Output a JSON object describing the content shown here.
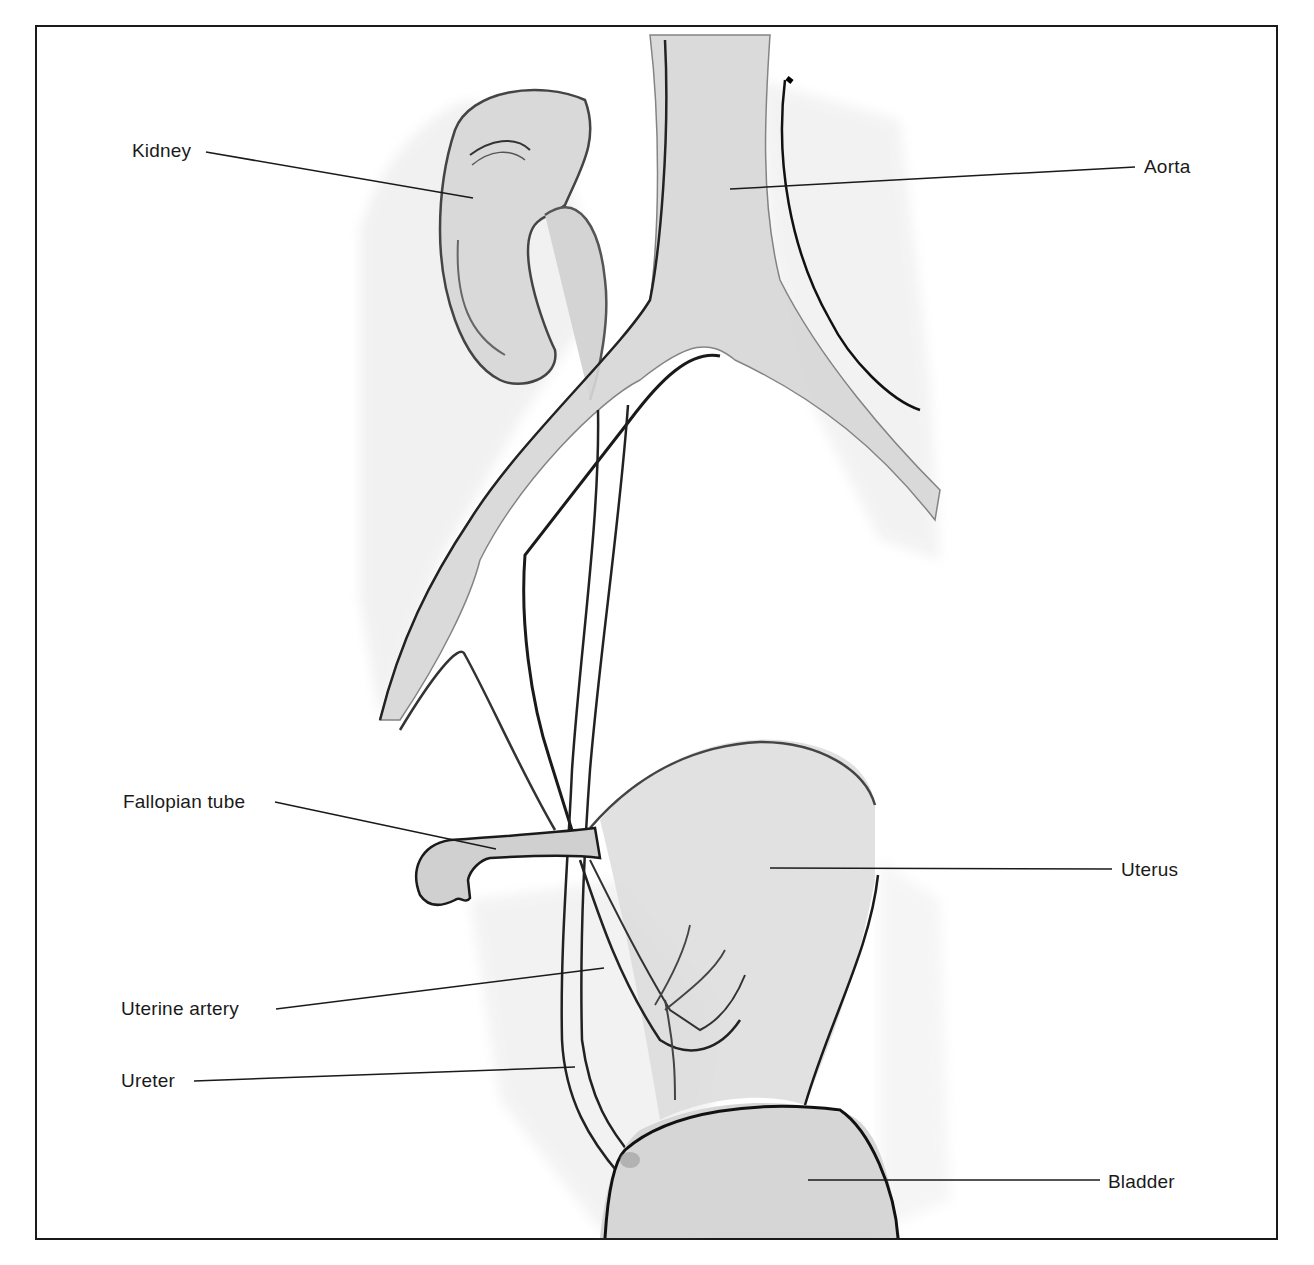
{
  "diagram": {
    "style": "grayscale pencil illustration",
    "colors": {
      "ink": "#1a1a1a",
      "shade": "#d8d8d8",
      "background": "#ffffff"
    },
    "labels": [
      {
        "id": "kidney",
        "text": "Kidney",
        "side": "left"
      },
      {
        "id": "aorta",
        "text": "Aorta",
        "side": "right"
      },
      {
        "id": "fallopian_tube",
        "text": "Fallopian tube",
        "side": "left"
      },
      {
        "id": "uterus",
        "text": "Uterus",
        "side": "right"
      },
      {
        "id": "uterine_artery",
        "text": "Uterine artery",
        "side": "left"
      },
      {
        "id": "ureter",
        "text": "Ureter",
        "side": "left"
      },
      {
        "id": "bladder",
        "text": "Bladder",
        "side": "right"
      }
    ]
  }
}
